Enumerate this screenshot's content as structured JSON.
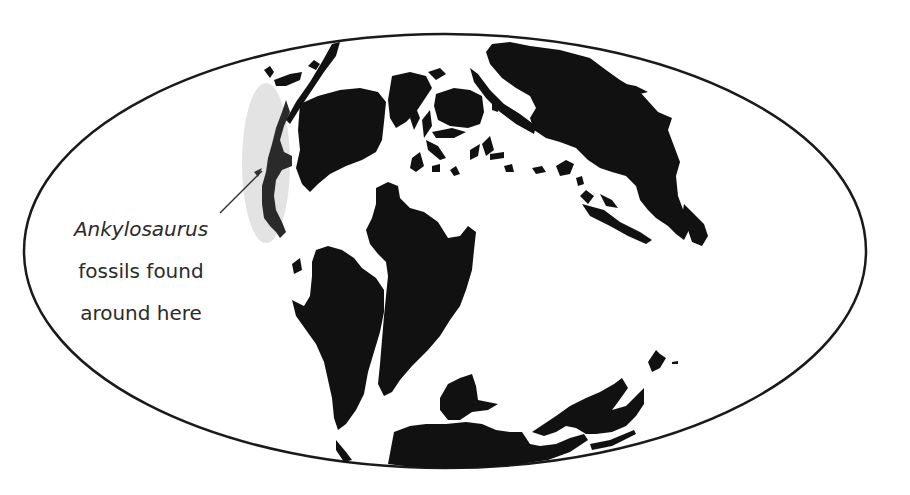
{
  "map": {
    "type": "paleogeographic world map",
    "projection": "elliptical (Mollweide-style)",
    "colors": {
      "land": "#111111",
      "ocean": "#ffffff",
      "outline": "#1a1a1a",
      "highlight": "#e3e3e3",
      "highlighted_land": "#2a2a2a",
      "pointer": "#333333",
      "text": "#2b2b2b"
    }
  },
  "annotation": {
    "line1": "Ankylosaurus",
    "line2": "fossils found",
    "line3": "around here",
    "line1_style": "italic"
  }
}
